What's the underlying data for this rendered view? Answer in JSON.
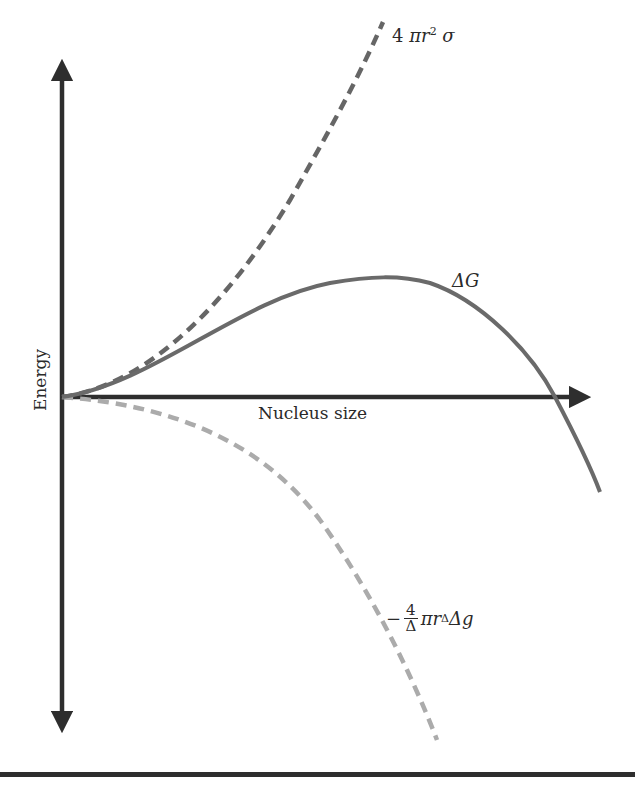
{
  "diagram": {
    "title": "",
    "x_axis": {
      "label": "Nucleus size"
    },
    "y_axis": {
      "label": "Energy"
    },
    "curves": [
      {
        "id": "surface",
        "label_prefix": "4 ",
        "label_pi_r": "πr",
        "label_exp": "2",
        "label_suffix": " σ",
        "style": "dashed",
        "color": "#666666"
      },
      {
        "id": "delta_g",
        "label": "ΔG",
        "style": "solid",
        "color": "#6a6a6a"
      },
      {
        "id": "volume",
        "label_minus": "−",
        "label_frac_num": "4",
        "label_frac_den": "Δ",
        "label_pi_r": "πr",
        "label_exp": "Δ",
        "label_suffix": "Δg",
        "style": "dashed",
        "color": "#ababab"
      }
    ],
    "colors": {
      "axis": "#2e2e2e",
      "surface_curve": "#666666",
      "delta_g_curve": "#6a6a6a",
      "volume_curve": "#ababab"
    }
  }
}
